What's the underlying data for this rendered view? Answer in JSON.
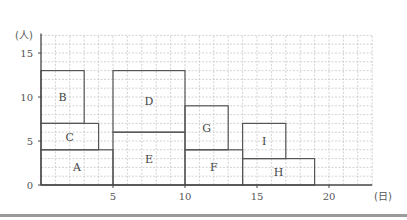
{
  "chart_data": {
    "type": "bar",
    "title": "",
    "xlabel": "(日)",
    "ylabel": "(人)",
    "xlim": [
      0,
      23
    ],
    "ylim": [
      0,
      17
    ],
    "xticks": [
      0,
      5,
      10,
      15,
      20
    ],
    "yticks": [
      0,
      5,
      10,
      15
    ],
    "grid": true,
    "rectangles": [
      {
        "label": "A",
        "x0": 0,
        "x1": 5,
        "y0": 0,
        "y1": 4
      },
      {
        "label": "C",
        "x0": 0,
        "x1": 4,
        "y0": 4,
        "y1": 7
      },
      {
        "label": "B",
        "x0": 0,
        "x1": 3,
        "y0": 7,
        "y1": 13
      },
      {
        "label": "E",
        "x0": 5,
        "x1": 10,
        "y0": 0,
        "y1": 6
      },
      {
        "label": "D",
        "x0": 5,
        "x1": 10,
        "y0": 6,
        "y1": 13
      },
      {
        "label": "F",
        "x0": 10,
        "x1": 14,
        "y0": 0,
        "y1": 4
      },
      {
        "label": "G",
        "x0": 10,
        "x1": 13,
        "y0": 4,
        "y1": 9
      },
      {
        "label": "H",
        "x0": 14,
        "x1": 19,
        "y0": 0,
        "y1": 3
      },
      {
        "label": "I",
        "x0": 14,
        "x1": 17,
        "y0": 3,
        "y1": 7
      }
    ]
  },
  "axis": {
    "y_unit": "(人)",
    "x_unit": "(日)",
    "y_tick_labels": [
      "0",
      "5",
      "10",
      "15"
    ],
    "x_tick_labels": [
      "5",
      "10",
      "15",
      "20"
    ]
  },
  "colors": {
    "grid": "#c8c8c8",
    "rect": "#555555",
    "axis": "#444444"
  }
}
